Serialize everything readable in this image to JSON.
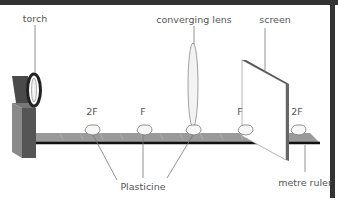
{
  "diagram": {
    "labels": {
      "torch": "torch",
      "lens": "converging lens",
      "screen": "screen",
      "plasticine": "Plasticine",
      "ruler": "metre ruler"
    },
    "markers": [
      "2F",
      "F",
      "F",
      "2F"
    ],
    "colors": {
      "border": "#333333",
      "ruler_top": "#9a9a9a",
      "ruler_edge": "#111111",
      "torch_body": "#555555",
      "screen_edge": "#666666",
      "leader_line": "#777777",
      "label_text": "#555555"
    }
  }
}
